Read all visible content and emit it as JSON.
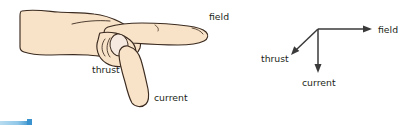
{
  "figure": {
    "background_color": "#ffffff"
  },
  "hand_diagram": {
    "name": "left-hand-illustration",
    "skin_fill": "#f9e3c8",
    "skin_shade": "#f3d6b2",
    "nail_fill": "#f6e9e0",
    "outline_color": "#3b2b20",
    "labels": {
      "field": "field",
      "thrust": "thrust",
      "current": "current"
    }
  },
  "vector_diagram": {
    "name": "vector-axes-diagram",
    "arrow_color": "#3a3a3a",
    "labels": {
      "field": "field",
      "thrust": "thrust",
      "current": "current"
    }
  },
  "corner_mark": {
    "name": "page-corner-accent",
    "color_light": "#8fc7e8",
    "color_dark": "#3a93cf"
  }
}
